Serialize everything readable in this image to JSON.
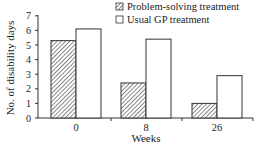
{
  "chart_data": {
    "type": "bar",
    "title": "",
    "xlabel": "Weeks",
    "ylabel": "No. of disability days",
    "categories": [
      "0",
      "8",
      "26"
    ],
    "series": [
      {
        "name": "Problem-solving treatment",
        "pattern": "hatched",
        "values": [
          5.3,
          2.4,
          1.0
        ]
      },
      {
        "name": "Usual GP treatment",
        "pattern": "open",
        "values": [
          6.1,
          5.4,
          2.9
        ]
      }
    ],
    "yticks": [
      0,
      1,
      2,
      3,
      4,
      5,
      6,
      7
    ],
    "ylim": [
      0,
      7
    ],
    "grid": false,
    "legend_position": "top-right"
  },
  "colors": {
    "axis": "#333333",
    "bar_edge": "#333333",
    "hatch": "#555555",
    "open_fill": "#ffffff"
  }
}
